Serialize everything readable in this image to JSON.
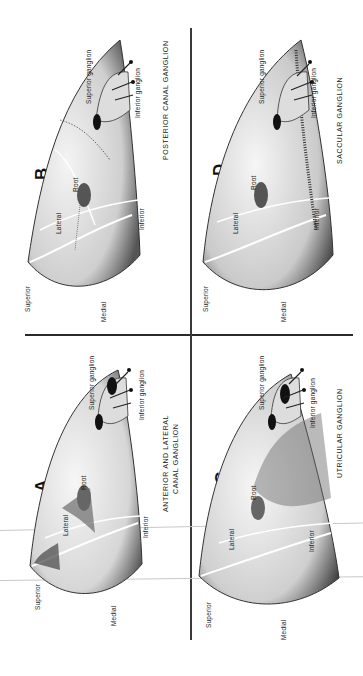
{
  "figure": {
    "orientation": "rotated 90deg counter-clockwise",
    "panels": [
      {
        "id": "A",
        "letter": "A",
        "caption_line1": "ANTERIOR AND LATERAL",
        "caption_line2": "CANAL  GANGLION",
        "labels": {
          "superior": "Superior",
          "medial": "Medial",
          "lateral": "Lateral",
          "inferior": "Inferior",
          "root": "Root",
          "superior_ganglion": "Superior  ganglion",
          "inferior_ganglion": "Inferior  ganglion"
        }
      },
      {
        "id": "B",
        "letter": "B",
        "caption_line1": "POSTERIOR  CANAL GANGLION",
        "labels": {
          "superior": "Superior",
          "medial": "Medial",
          "lateral": "Lateral",
          "inferior": "Inferior",
          "root": "Root",
          "superior_ganglion": "Superior  ganglion",
          "inferior_ganglion": "Inferior  ganglion"
        }
      },
      {
        "id": "C",
        "letter": "C",
        "caption_line1": "UTRICULAR  GANGLION",
        "labels": {
          "superior": "Superior",
          "medial": "Medial",
          "lateral": "Lateral",
          "inferior": "Inferior",
          "root": "Root",
          "superior_ganglion": "Superior  ganglion",
          "inferior_ganglion": "Inferior  ganglion"
        }
      },
      {
        "id": "D",
        "letter": "D",
        "caption_line1": "SACCULAR  GANGLION",
        "labels": {
          "superior": "Superior",
          "medial": "Medial",
          "lateral": "Lateral",
          "inferior": "Inferior",
          "root": "Root",
          "superior_ganglion": "Superior  ganglion",
          "inferior_ganglion": "Inferior  ganglion"
        }
      }
    ]
  }
}
